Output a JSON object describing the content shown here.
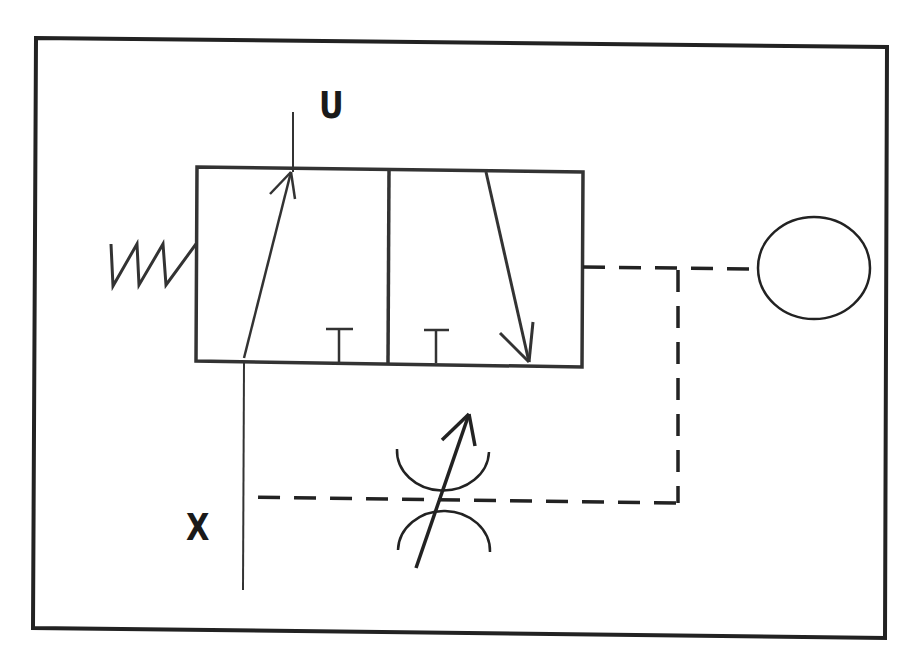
{
  "diagram": {
    "type": "pneumatic/hydraulic schematic",
    "title": "",
    "labels": {
      "output_port": "U",
      "input_port": "X"
    },
    "components": [
      {
        "id": "frame",
        "kind": "outer-border"
      },
      {
        "id": "valve",
        "kind": "3/2 directional valve, two positions",
        "left_box": "flow arrow up to U, blocked port T",
        "right_box": "blocked port T, flow arrow down"
      },
      {
        "id": "spring",
        "kind": "spring return",
        "side": "left"
      },
      {
        "id": "pilot",
        "kind": "pilot/control line (dashed) from valve right side"
      },
      {
        "id": "reservoir",
        "kind": "ellipse (pressure vessel / accumulator)"
      },
      {
        "id": "throttle",
        "kind": "adjustable throttle (variable restrictor)"
      },
      {
        "id": "supply",
        "kind": "supply line from X into valve"
      }
    ],
    "colors": {
      "line": "#2b2b2b",
      "background": "#ffffff"
    }
  }
}
